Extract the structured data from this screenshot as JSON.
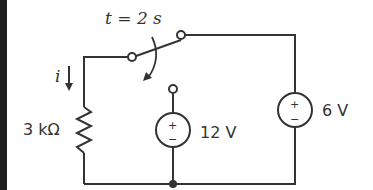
{
  "diagram": {
    "type": "circuit",
    "switch_label": "t = 2 s",
    "current_label": "i",
    "resistor": {
      "label": "3 kΩ"
    },
    "sources": [
      {
        "id": "v12",
        "label": "12 V",
        "plus": "+",
        "minus": "−"
      },
      {
        "id": "v6",
        "label": "6 V",
        "plus": "+",
        "minus": "−"
      }
    ],
    "colors": {
      "wire": "#333333",
      "text": "#333333",
      "left_bar": "#1e1e1e"
    }
  }
}
